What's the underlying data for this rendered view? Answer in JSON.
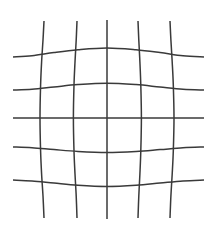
{
  "canvas": {
    "width": 214,
    "height": 235,
    "background_color": "#ffffff"
  },
  "figure": {
    "kind": "distortion-grid",
    "distortion_type": "pincushion",
    "line_color": "#3a3a3a",
    "line_width": 1.5,
    "vertical_count": 5,
    "horizontal_count": 5
  },
  "chart_data": {
    "type": "line",
    "title": "",
    "subtitle": "",
    "xlabel": "",
    "ylabel": "",
    "grid": true,
    "legend_position": "none",
    "xlim": [
      0,
      214
    ],
    "ylim": [
      0,
      235
    ],
    "tick_labels_x": [],
    "tick_labels_y": [],
    "annotations": [],
    "series": [
      {
        "name": "vertical-1",
        "orientation": "vertical",
        "points": [
          [
            44.0,
            21.0
          ],
          [
            43.0,
            40.0
          ],
          [
            41.6,
            62.0
          ],
          [
            40.6,
            85.0
          ],
          [
            40.0,
            118.0
          ],
          [
            40.6,
            151.0
          ],
          [
            41.6,
            174.0
          ],
          [
            43.0,
            196.0
          ],
          [
            44.0,
            218.0
          ]
        ]
      },
      {
        "name": "vertical-2",
        "orientation": "vertical",
        "points": [
          [
            77.0,
            21.0
          ],
          [
            76.2,
            40.0
          ],
          [
            75.0,
            62.0
          ],
          [
            74.0,
            85.0
          ],
          [
            73.4,
            118.0
          ],
          [
            74.0,
            151.0
          ],
          [
            75.0,
            174.0
          ],
          [
            76.2,
            196.0
          ],
          [
            77.0,
            218.0
          ]
        ]
      },
      {
        "name": "vertical-3-center",
        "orientation": "vertical",
        "points": [
          [
            107.0,
            20.0
          ],
          [
            107.0,
            60.0
          ],
          [
            107.0,
            118.0
          ],
          [
            107.0,
            176.0
          ],
          [
            107.0,
            219.0
          ]
        ]
      },
      {
        "name": "vertical-4",
        "orientation": "vertical",
        "points": [
          [
            138.0,
            21.0
          ],
          [
            138.8,
            40.0
          ],
          [
            139.9,
            62.0
          ],
          [
            140.8,
            85.0
          ],
          [
            141.4,
            118.0
          ],
          [
            140.8,
            151.0
          ],
          [
            139.9,
            174.0
          ],
          [
            138.8,
            196.0
          ],
          [
            138.0,
            218.0
          ]
        ]
      },
      {
        "name": "vertical-5",
        "orientation": "vertical",
        "points": [
          [
            170.0,
            21.0
          ],
          [
            170.9,
            40.0
          ],
          [
            172.2,
            62.0
          ],
          [
            173.3,
            85.0
          ],
          [
            174.0,
            118.0
          ],
          [
            173.3,
            151.0
          ],
          [
            172.2,
            174.0
          ],
          [
            170.9,
            196.0
          ],
          [
            170.0,
            218.0
          ]
        ]
      },
      {
        "name": "horizontal-1",
        "orientation": "horizontal",
        "points": [
          [
            13.0,
            57.0
          ],
          [
            32.0,
            55.8
          ],
          [
            54.0,
            52.6
          ],
          [
            78.0,
            49.8
          ],
          [
            107.0,
            48.0
          ],
          [
            136.0,
            49.8
          ],
          [
            160.0,
            52.6
          ],
          [
            183.0,
            55.8
          ],
          [
            204.0,
            57.0
          ]
        ]
      },
      {
        "name": "horizontal-2",
        "orientation": "horizontal",
        "points": [
          [
            13.0,
            90.0
          ],
          [
            32.0,
            89.2
          ],
          [
            54.0,
            87.0
          ],
          [
            78.0,
            84.6
          ],
          [
            107.0,
            83.2
          ],
          [
            136.0,
            84.6
          ],
          [
            160.0,
            87.0
          ],
          [
            183.0,
            89.2
          ],
          [
            204.0,
            90.0
          ]
        ]
      },
      {
        "name": "horizontal-3-center",
        "orientation": "horizontal",
        "points": [
          [
            13.0,
            118.0
          ],
          [
            60.0,
            118.0
          ],
          [
            107.0,
            118.0
          ],
          [
            155.0,
            118.0
          ],
          [
            204.0,
            118.0
          ]
        ]
      },
      {
        "name": "horizontal-4",
        "orientation": "horizontal",
        "points": [
          [
            13.0,
            147.0
          ],
          [
            32.0,
            147.8
          ],
          [
            54.0,
            149.6
          ],
          [
            78.0,
            151.4
          ],
          [
            107.0,
            152.4
          ],
          [
            136.0,
            151.4
          ],
          [
            160.0,
            149.6
          ],
          [
            183.0,
            147.8
          ],
          [
            204.0,
            147.0
          ]
        ]
      },
      {
        "name": "horizontal-5",
        "orientation": "horizontal",
        "points": [
          [
            13.0,
            180.0
          ],
          [
            32.0,
            180.9
          ],
          [
            54.0,
            183.0
          ],
          [
            78.0,
            185.2
          ],
          [
            107.0,
            186.4
          ],
          [
            136.0,
            185.2
          ],
          [
            160.0,
            183.0
          ],
          [
            183.0,
            180.9
          ],
          [
            204.0,
            180.0
          ]
        ]
      }
    ]
  }
}
